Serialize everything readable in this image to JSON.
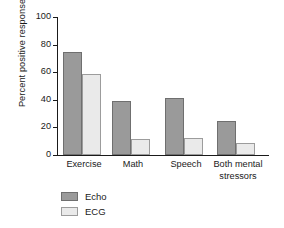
{
  "chart_data": {
    "type": "bar",
    "title": "",
    "xlabel": "",
    "ylabel": "Percent positive response",
    "ylim": [
      0,
      100
    ],
    "yticks": [
      0,
      20,
      40,
      60,
      80,
      100
    ],
    "ytick_labels": [
      "0",
      "20",
      "40",
      "60",
      "80",
      "100"
    ],
    "grid": false,
    "legend_position": "below-left",
    "categories": [
      "Exercise",
      "Math",
      "Speech",
      "Both mental stressors"
    ],
    "category_lines": [
      [
        "Exercise"
      ],
      [
        "Math"
      ],
      [
        "Speech"
      ],
      [
        "Both mental",
        "stressors"
      ]
    ],
    "series": [
      {
        "name": "Echo",
        "color": "#9a9a9a",
        "values": [
          75,
          39,
          41.5,
          24.5
        ]
      },
      {
        "name": "ECG",
        "color": "#eaeaea",
        "values": [
          59,
          11.5,
          12.5,
          8.5
        ]
      }
    ]
  },
  "legend": {
    "items": [
      {
        "label": "Echo"
      },
      {
        "label": "ECG"
      }
    ]
  },
  "colors": {
    "echo": "#9a9a9a",
    "ecg": "#eaeaea",
    "axis": "#1a1a1a",
    "bar_outline": "#6f6f6f",
    "background": "#ffffff"
  }
}
